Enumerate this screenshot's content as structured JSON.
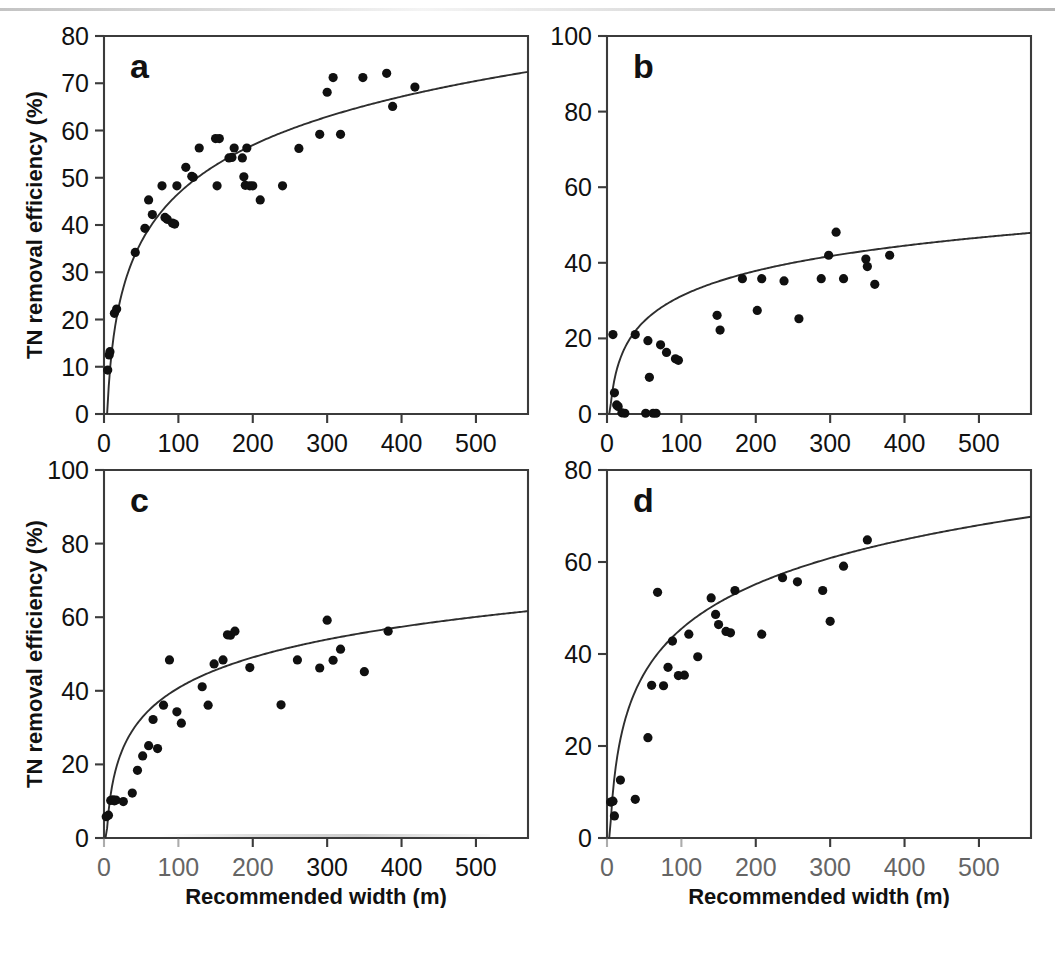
{
  "figure": {
    "background_color": "#ffffff",
    "ink_color": "#101010",
    "axis_color": "#3b3b3b",
    "xlabel": "Recommended width (m)",
    "ylabel": "TN removal efficiency (%)"
  },
  "chart_data": [
    {
      "id": "a",
      "panel_letter": "a",
      "type": "scatter",
      "title": "",
      "xlabel": "",
      "ylabel": "TN removal efficiency (%)",
      "xlim": [
        0,
        570
      ],
      "ylim": [
        0,
        80
      ],
      "xticks": [
        0,
        100,
        200,
        300,
        400,
        500
      ],
      "yticks": [
        0,
        10,
        20,
        30,
        40,
        50,
        60,
        70,
        80
      ],
      "xticklabels": [
        "0",
        "100",
        "200",
        "300",
        "400",
        "500"
      ],
      "yticklabels": [
        "0",
        "10",
        "20",
        "30",
        "40",
        "50",
        "60",
        "70",
        "80"
      ],
      "grid": false,
      "legend": null,
      "series": [
        {
          "name": "observations",
          "marker": "filled-circle",
          "points": [
            [
              5,
              9.3
            ],
            [
              7,
              12.5
            ],
            [
              8,
              13.2
            ],
            [
              14,
              21.3
            ],
            [
              17,
              22.2
            ],
            [
              42,
              34.2
            ],
            [
              55,
              39.3
            ],
            [
              60,
              45.3
            ],
            [
              65,
              42.2
            ],
            [
              78,
              48.3
            ],
            [
              82,
              41.6
            ],
            [
              85,
              41.2
            ],
            [
              92,
              40.4
            ],
            [
              95,
              40.2
            ],
            [
              98,
              48.3
            ],
            [
              110,
              52.2
            ],
            [
              118,
              50.3
            ],
            [
              120,
              50.1
            ],
            [
              128,
              56.3
            ],
            [
              150,
              58.3
            ],
            [
              155,
              58.3
            ],
            [
              152,
              48.3
            ],
            [
              168,
              54.2
            ],
            [
              172,
              54.3
            ],
            [
              175,
              56.3
            ],
            [
              186,
              54.2
            ],
            [
              188,
              50.2
            ],
            [
              190,
              48.4
            ],
            [
              192,
              56.3
            ],
            [
              196,
              48.3
            ],
            [
              200,
              48.3
            ],
            [
              210,
              45.3
            ],
            [
              240,
              48.3
            ],
            [
              262,
              56.2
            ],
            [
              290,
              59.2
            ],
            [
              300,
              68.1
            ],
            [
              308,
              71.2
            ],
            [
              318,
              59.2
            ],
            [
              348,
              71.2
            ],
            [
              380,
              72.1
            ],
            [
              388,
              65.1
            ],
            [
              418,
              69.2
            ]
          ]
        }
      ],
      "fit_curve": {
        "kind": "logarithmic",
        "description": "y = a*ln(x) + b fitted trend",
        "a": 14.8,
        "b": -21.5,
        "x_start": 2,
        "x_end": 570
      }
    },
    {
      "id": "b",
      "panel_letter": "b",
      "type": "scatter",
      "title": "",
      "xlabel": "",
      "ylabel": "",
      "xlim": [
        0,
        570
      ],
      "ylim": [
        0,
        100
      ],
      "xticks": [
        0,
        100,
        200,
        300,
        400,
        500
      ],
      "yticks": [
        0,
        20,
        40,
        60,
        80,
        100
      ],
      "xticklabels": [
        "0",
        "100",
        "200",
        "300",
        "400",
        "500"
      ],
      "yticklabels": [
        "0",
        "20",
        "40",
        "60",
        "80",
        "100"
      ],
      "grid": false,
      "legend": null,
      "series": [
        {
          "name": "observations",
          "marker": "filled-circle",
          "points": [
            [
              8,
              21.0
            ],
            [
              10,
              5.6
            ],
            [
              13,
              2.4
            ],
            [
              15,
              2.0
            ],
            [
              20,
              0.3
            ],
            [
              24,
              0.2
            ],
            [
              38,
              21.0
            ],
            [
              52,
              0.2
            ],
            [
              55,
              19.4
            ],
            [
              57,
              9.7
            ],
            [
              62,
              0.2
            ],
            [
              66,
              0.2
            ],
            [
              72,
              18.3
            ],
            [
              80,
              16.3
            ],
            [
              92,
              14.6
            ],
            [
              96,
              14.2
            ],
            [
              148,
              26.1
            ],
            [
              152,
              22.2
            ],
            [
              182,
              35.8
            ],
            [
              202,
              27.4
            ],
            [
              208,
              35.8
            ],
            [
              238,
              35.2
            ],
            [
              258,
              25.2
            ],
            [
              288,
              35.8
            ],
            [
              298,
              42.0
            ],
            [
              308,
              48.1
            ],
            [
              318,
              35.8
            ],
            [
              348,
              41.0
            ],
            [
              350,
              39.0
            ],
            [
              360,
              34.3
            ],
            [
              380,
              42.0
            ]
          ]
        }
      ],
      "fit_curve": {
        "kind": "logarithmic",
        "description": "y = a*ln(x) + b fitted trend",
        "a": 9.6,
        "b": -13.0,
        "x_start": 3,
        "x_end": 570
      }
    },
    {
      "id": "c",
      "panel_letter": "c",
      "type": "scatter",
      "title": "",
      "xlabel": "Recommended width (m)",
      "ylabel": "TN removal efficiency (%)",
      "xlim": [
        0,
        570
      ],
      "ylim": [
        0,
        100
      ],
      "xticks": [
        0,
        100,
        200,
        300,
        400,
        500
      ],
      "yticks": [
        0,
        20,
        40,
        60,
        80,
        100
      ],
      "xticklabels": [
        "0",
        "100",
        "200",
        "300",
        "400",
        "500"
      ],
      "yticklabels": [
        "0",
        "20",
        "40",
        "60",
        "80",
        "100"
      ],
      "grid": false,
      "legend": null,
      "note": "bottom axis partially degraded in scan",
      "series": [
        {
          "name": "observations",
          "marker": "filled-circle",
          "points": [
            [
              3,
              5.8
            ],
            [
              6,
              6.2
            ],
            [
              9,
              10.2
            ],
            [
              12,
              10.4
            ],
            [
              14,
              10.1
            ],
            [
              16,
              10.3
            ],
            [
              26,
              9.9
            ],
            [
              38,
              12.2
            ],
            [
              45,
              18.4
            ],
            [
              52,
              22.3
            ],
            [
              60,
              25.1
            ],
            [
              66,
              32.2
            ],
            [
              72,
              24.3
            ],
            [
              80,
              36.1
            ],
            [
              88,
              48.4
            ],
            [
              98,
              34.3
            ],
            [
              104,
              31.2
            ],
            [
              132,
              41.1
            ],
            [
              140,
              36.1
            ],
            [
              148,
              47.3
            ],
            [
              160,
              48.4
            ],
            [
              166,
              55.2
            ],
            [
              170,
              55.1
            ],
            [
              176,
              56.2
            ],
            [
              196,
              46.3
            ],
            [
              238,
              36.2
            ],
            [
              260,
              48.4
            ],
            [
              290,
              46.2
            ],
            [
              300,
              59.2
            ],
            [
              308,
              48.3
            ],
            [
              318,
              51.3
            ],
            [
              350,
              45.2
            ],
            [
              382,
              56.2
            ]
          ]
        }
      ],
      "fit_curve": {
        "kind": "logarithmic",
        "description": "y = a*ln(x) + b fitted trend",
        "a": 12.0,
        "b": -14.5,
        "x_start": 2,
        "x_end": 570
      }
    },
    {
      "id": "d",
      "panel_letter": "d",
      "type": "scatter",
      "title": "",
      "xlabel": "Recommended width (m)",
      "ylabel": "",
      "xlim": [
        0,
        570
      ],
      "ylim": [
        0,
        80
      ],
      "xticks": [
        0,
        100,
        200,
        300,
        400,
        500
      ],
      "yticks": [
        0,
        20,
        40,
        60,
        80
      ],
      "xticklabels": [
        "0",
        "100",
        "200",
        "300",
        "400",
        "500"
      ],
      "yticklabels": [
        "0",
        "20",
        "40",
        "60",
        "80"
      ],
      "grid": false,
      "legend": null,
      "note": "bottom tick labels partially degraded in scan",
      "series": [
        {
          "name": "observations",
          "marker": "filled-circle",
          "points": [
            [
              5,
              7.8
            ],
            [
              8,
              8.0
            ],
            [
              10,
              4.8
            ],
            [
              18,
              12.6
            ],
            [
              38,
              8.4
            ],
            [
              55,
              21.8
            ],
            [
              60,
              33.2
            ],
            [
              68,
              53.4
            ],
            [
              76,
              33.1
            ],
            [
              82,
              37.1
            ],
            [
              88,
              42.8
            ],
            [
              96,
              35.3
            ],
            [
              104,
              35.4
            ],
            [
              110,
              44.3
            ],
            [
              122,
              39.4
            ],
            [
              140,
              52.2
            ],
            [
              146,
              48.6
            ],
            [
              150,
              46.4
            ],
            [
              160,
              44.9
            ],
            [
              166,
              44.6
            ],
            [
              172,
              53.8
            ],
            [
              208,
              44.3
            ],
            [
              236,
              56.6
            ],
            [
              256,
              55.7
            ],
            [
              290,
              53.8
            ],
            [
              300,
              47.1
            ],
            [
              318,
              59.1
            ],
            [
              350,
              64.8
            ]
          ]
        }
      ],
      "fit_curve": {
        "kind": "logarithmic",
        "description": "y = a*ln(x) + b fitted trend",
        "a": 14.0,
        "b": -19.0,
        "x_start": 3,
        "x_end": 570
      }
    }
  ]
}
